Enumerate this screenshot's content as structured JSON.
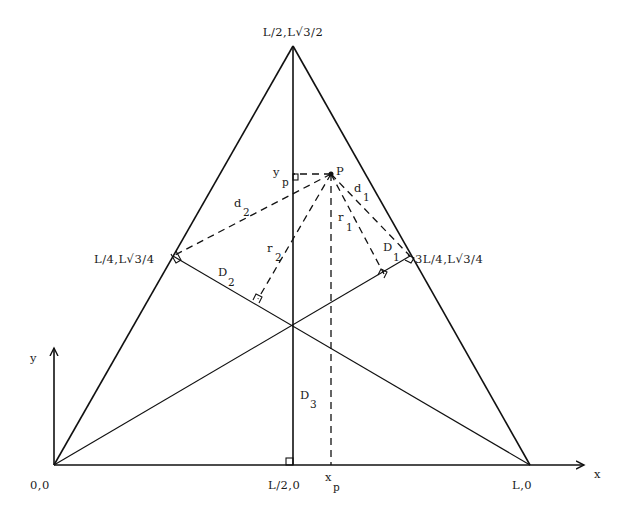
{
  "figure": {
    "vertices": {
      "bottom_left": "0,0",
      "bottom_right": "L,0",
      "apex": "L/2,L√3/2"
    },
    "midpoints": {
      "left_side": "L/4,L√3/4",
      "right_side": "3L/4,L√3/4",
      "base": "L/2,0"
    },
    "point": {
      "name": "P"
    },
    "axes": {
      "x": "x",
      "y": "y"
    },
    "projections": {
      "x": {
        "main": "x",
        "sub": "p"
      },
      "y": {
        "main": "y",
        "sub": "p"
      }
    },
    "distances": {
      "d1": {
        "main": "d",
        "sub": "1"
      },
      "d2": {
        "main": "d",
        "sub": "2"
      },
      "r1": {
        "main": "r",
        "sub": "1"
      },
      "r2": {
        "main": "r",
        "sub": "2"
      },
      "D1": {
        "main": "D",
        "sub": "1"
      },
      "D2": {
        "main": "D",
        "sub": "2"
      },
      "D3": {
        "main": "D",
        "sub": "3"
      }
    }
  }
}
